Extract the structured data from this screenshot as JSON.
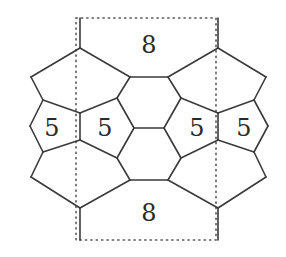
{
  "diagram": {
    "type": "polyhedral-net / fullerene-patch",
    "colors": {
      "edge": "#3a3a3a",
      "dotted": "#555555",
      "label": "#2a2a2a",
      "background": "#ffffff"
    },
    "dotted_boundary": {
      "x1": 76,
      "y1": 18,
      "x2": 216,
      "y2": 240
    },
    "edges": [
      [
        80,
        18,
        80,
        48
      ],
      [
        218,
        18,
        218,
        48
      ],
      [
        80,
        240,
        80,
        208
      ],
      [
        218,
        240,
        218,
        208
      ],
      [
        80,
        48,
        31,
        77
      ],
      [
        31,
        77,
        43,
        100
      ],
      [
        43,
        100,
        80,
        113
      ],
      [
        80,
        48,
        130,
        77
      ],
      [
        130,
        77,
        117,
        98
      ],
      [
        117,
        98,
        80,
        113
      ],
      [
        218,
        48,
        168,
        77
      ],
      [
        218,
        48,
        266,
        77
      ],
      [
        266,
        77,
        254,
        100
      ],
      [
        254,
        100,
        218,
        113
      ],
      [
        168,
        77,
        181,
        98
      ],
      [
        181,
        98,
        218,
        113
      ],
      [
        130,
        77,
        168,
        77
      ],
      [
        43,
        100,
        30,
        126
      ],
      [
        30,
        126,
        43,
        152
      ],
      [
        80,
        113,
        80,
        140
      ],
      [
        43,
        152,
        80,
        140
      ],
      [
        117,
        98,
        134,
        128
      ],
      [
        134,
        128,
        117,
        158
      ],
      [
        117,
        158,
        80,
        140
      ],
      [
        254,
        100,
        268,
        126
      ],
      [
        268,
        126,
        254,
        152
      ],
      [
        218,
        113,
        218,
        140
      ],
      [
        254,
        152,
        218,
        140
      ],
      [
        181,
        98,
        164,
        128
      ],
      [
        164,
        128,
        181,
        158
      ],
      [
        181,
        158,
        218,
        140
      ],
      [
        134,
        128,
        164,
        128
      ],
      [
        43,
        152,
        31,
        177
      ],
      [
        31,
        177,
        80,
        208
      ],
      [
        117,
        158,
        130,
        180
      ],
      [
        130,
        180,
        80,
        208
      ],
      [
        181,
        158,
        168,
        180
      ],
      [
        168,
        180,
        218,
        208
      ],
      [
        254,
        152,
        266,
        177
      ],
      [
        266,
        177,
        218,
        208
      ],
      [
        130,
        180,
        168,
        180
      ]
    ],
    "labels": [
      {
        "name": "top-octagon-label",
        "text": "8",
        "x": 149,
        "y": 45
      },
      {
        "name": "bottom-octagon-label",
        "text": "8",
        "x": 149,
        "y": 213
      },
      {
        "name": "pentagon-label-1",
        "text": "5",
        "x": 52,
        "y": 128
      },
      {
        "name": "pentagon-label-2",
        "text": "5",
        "x": 105,
        "y": 128
      },
      {
        "name": "pentagon-label-3",
        "text": "5",
        "x": 197,
        "y": 128
      },
      {
        "name": "pentagon-label-4",
        "text": "5",
        "x": 244,
        "y": 128
      }
    ]
  }
}
